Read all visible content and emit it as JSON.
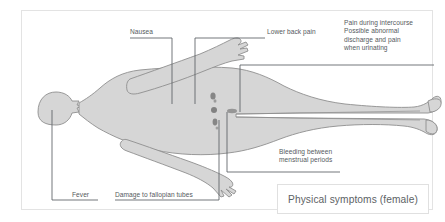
{
  "diagram": {
    "caption": "Physical symptoms (female)",
    "colors": {
      "body_fill": "#d6d6d6",
      "body_stroke": "#8e8e8e",
      "leader_line": "#5a5f63",
      "text": "#555a5e",
      "frame_border": "#e3e3e3",
      "caption_border": "#e0e0e0",
      "background": "#ffffff",
      "marking": "#6b6b6b"
    },
    "labels": [
      {
        "id": "nausea",
        "text": "Nausea"
      },
      {
        "id": "lower_back_pain",
        "text": "Lower back pain"
      },
      {
        "id": "pain_intercourse",
        "lines": [
          "Pain during intercourse",
          "Possible abnormal",
          "discharge and pain",
          "when urinating"
        ]
      },
      {
        "id": "bleeding",
        "lines": [
          "Bleeding between",
          "menstrual periods"
        ]
      },
      {
        "id": "fever",
        "text": "Fever"
      },
      {
        "id": "fallopian",
        "text": "Damage to fallopian tubes"
      }
    ]
  }
}
